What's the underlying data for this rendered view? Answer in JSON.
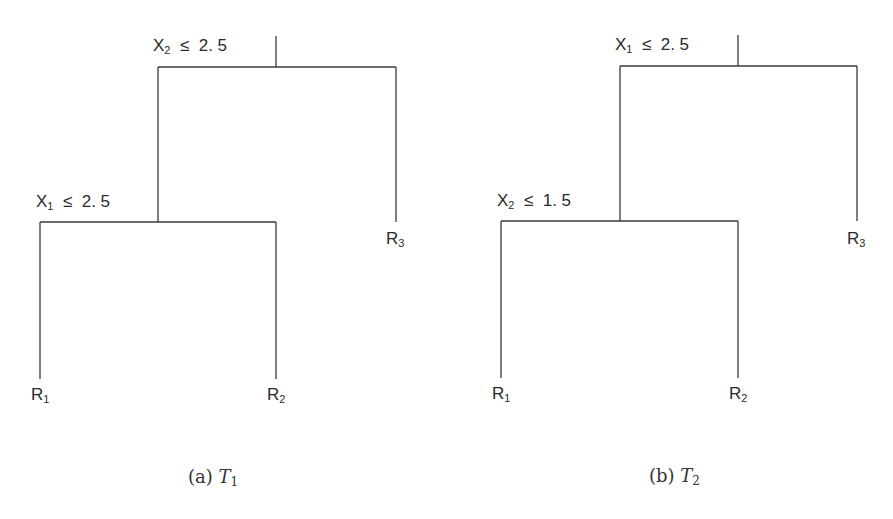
{
  "figure": {
    "trees": [
      {
        "id": "T1",
        "caption": {
          "prefix": "(a)",
          "var": "T",
          "sub": "1"
        },
        "root_split": {
          "var": "X",
          "sub": "2",
          "op": "≤",
          "value": "2. 5"
        },
        "child_split": {
          "var": "X",
          "sub": "1",
          "op": "≤",
          "value": "2. 5"
        },
        "leaves": [
          {
            "var": "R",
            "sub": "1"
          },
          {
            "var": "R",
            "sub": "2"
          },
          {
            "var": "R",
            "sub": "3"
          }
        ]
      },
      {
        "id": "T2",
        "caption": {
          "prefix": "(b)",
          "var": "T",
          "sub": "2"
        },
        "root_split": {
          "var": "X",
          "sub": "1",
          "op": "≤",
          "value": "2. 5"
        },
        "child_split": {
          "var": "X",
          "sub": "2",
          "op": "≤",
          "value": "1. 5"
        },
        "leaves": [
          {
            "var": "R",
            "sub": "1"
          },
          {
            "var": "R",
            "sub": "2"
          },
          {
            "var": "R",
            "sub": "3"
          }
        ]
      }
    ]
  },
  "style": {
    "line_color": "#3a3a3a",
    "text_color": "#2a2a2a",
    "background": "#ffffff"
  }
}
